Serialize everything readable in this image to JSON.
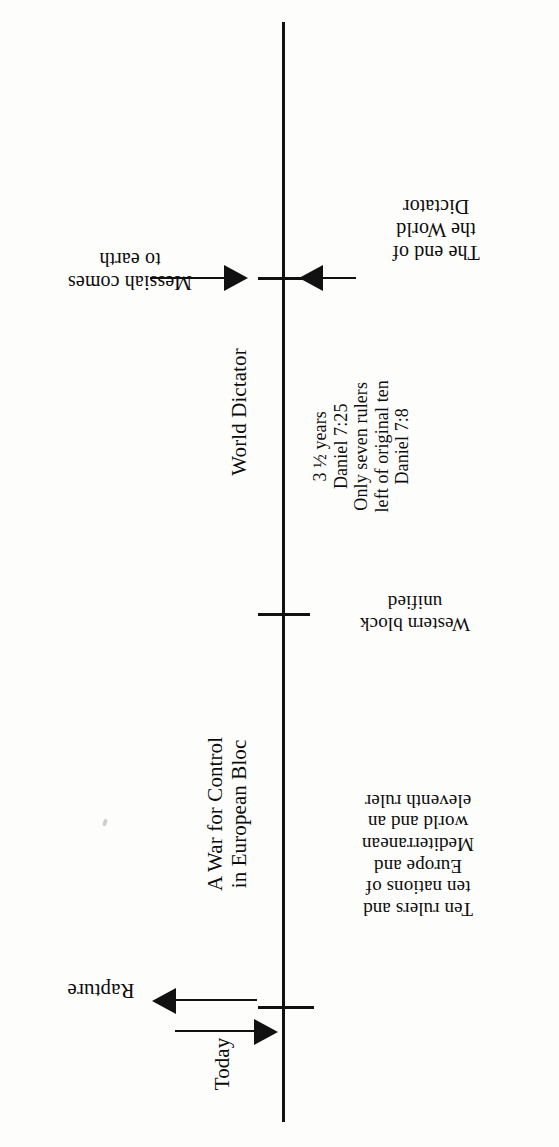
{
  "diagram": {
    "orientation": "vertical axis, labels rotated 90 and 180 degrees",
    "ink_color": "#111111",
    "paper_color": "#fdfdfb"
  },
  "axis": {
    "name": "timeline-axis",
    "ticks": [
      {
        "id": "end-of-world",
        "label": "The end of\nthe World\nDictator"
      },
      {
        "id": "western-block",
        "label": "Western block\nunified"
      },
      {
        "id": "today",
        "label": "Today"
      }
    ]
  },
  "labels": {
    "messiah": "Messiah comes\nto earth",
    "end_of_world": "The end of\nthe World\nDictator",
    "world_dictator": "World Dictator",
    "daniel_block": "3 ½ years\nDaniel 7:25\nOnly seven rulers\nleft of original ten\nDaniel 7:8",
    "western_block": "Western block\nunified",
    "war_control": "A War for Control\nin European Bloc",
    "ten_rulers": "Ten rulers and\nten nations of\nEurope and\nMediterranean\nworld and an\neleventh ruler",
    "rapture": "Rapture",
    "today": "Today"
  },
  "scripture_references": [
    "Daniel 7:25",
    "Daniel 7:8"
  ],
  "durations": [
    "3 ½ years"
  ],
  "arrows": [
    {
      "id": "arrow-messiah",
      "direction": "right",
      "points_to": "timeline-axis"
    },
    {
      "id": "arrow-end-of-world",
      "direction": "left",
      "points_to": "timeline-axis"
    },
    {
      "id": "arrow-rapture-out",
      "direction": "left",
      "points_to": "rapture-label"
    },
    {
      "id": "arrow-rapture-in",
      "direction": "right",
      "points_to": "timeline-axis"
    }
  ]
}
